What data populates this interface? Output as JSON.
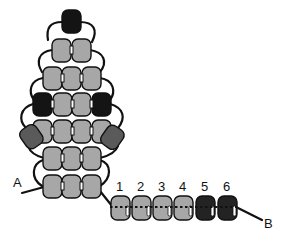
{
  "diagram": {
    "type": "beadwork-stitch-diagram",
    "colors": {
      "gray_bead": "#a7a7a7",
      "black_bead": "#141414",
      "dark_gray_bead": "#5a5a5a",
      "thread": "#111111",
      "background": "#ffffff"
    },
    "labels": {
      "thread_end_a": "A",
      "thread_end_b": "B"
    },
    "pyramid_rows": [
      {
        "row": 1,
        "beads": [
          "black"
        ]
      },
      {
        "row": 2,
        "beads": [
          "gray",
          "gray"
        ]
      },
      {
        "row": 3,
        "beads": [
          "gray",
          "gray",
          "gray"
        ]
      },
      {
        "row": 4,
        "beads": [
          "black",
          "gray",
          "gray",
          "black"
        ]
      },
      {
        "row": 5,
        "beads": [
          "gray",
          "gray",
          "gray",
          "gray"
        ],
        "side_beads": [
          "dark-gray",
          "dark-gray"
        ]
      },
      {
        "row": 6,
        "beads": [
          "gray",
          "gray",
          "gray"
        ]
      },
      {
        "row": 7,
        "beads": [
          "gray",
          "gray",
          "gray"
        ]
      }
    ],
    "strand": {
      "bead_numbers": [
        "1",
        "2",
        "3",
        "4",
        "5",
        "6"
      ],
      "bead_colors": [
        "gray",
        "gray",
        "gray",
        "gray",
        "black",
        "black"
      ]
    }
  }
}
